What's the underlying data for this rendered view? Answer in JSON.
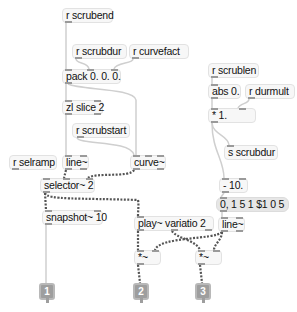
{
  "patcher": {
    "objects": {
      "r_scrubend": "r scrubend",
      "r_scrubdur": "r scrubdur",
      "r_curvefact": "r curvefact",
      "pack": "pack 0. 0. 0.",
      "zl_slice": "zl slice 2",
      "r_scrubstart": "r scrubstart",
      "r_selramp": "r selramp",
      "line_left": "line~",
      "curve": "curve~",
      "selector": "selector~ 2",
      "snapshot": "snapshot~ 10",
      "play": "play~ variatio 2",
      "r_scrublen": "r scrublen",
      "abs": "abs 0.",
      "r_durmult": "r durmult",
      "mult": "* 1.",
      "s_scrubdur": "s scrubdur",
      "minus": "- 10.",
      "message": "0, 1 5 1 $1 0 5",
      "line_right": "line~",
      "times_sig_left": "*~",
      "times_sig_right": "*~"
    },
    "outlets": [
      "1",
      "2",
      "3"
    ],
    "colors": {
      "object_bg": "#f7f7f7",
      "message_bg": "#e6e6e6",
      "control_cord": "#c8c8c8",
      "signal_cord": "#555555",
      "outlet": "#9e9e9e"
    }
  }
}
